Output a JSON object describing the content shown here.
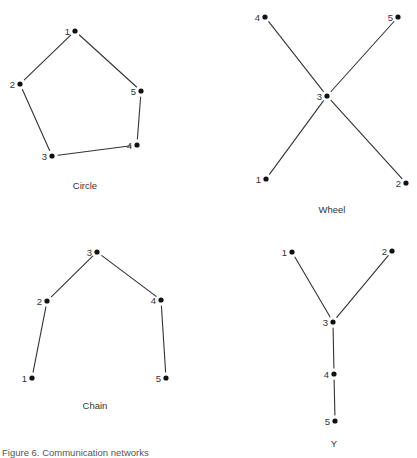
{
  "figure": {
    "caption": "Figure 6.  Communication networks",
    "ink_color": "#111111",
    "line_color": "#333333",
    "background": "#ffffff"
  },
  "networks": [
    {
      "id": "circle",
      "label": "Circle",
      "label_pos": [
        85,
        189
      ],
      "nodes": [
        {
          "id": "1",
          "x": 75,
          "y": 31
        },
        {
          "id": "2",
          "x": 20,
          "y": 84
        },
        {
          "id": "3",
          "x": 52,
          "y": 156
        },
        {
          "id": "4",
          "x": 137,
          "y": 145
        },
        {
          "id": "5",
          "x": 141,
          "y": 91
        }
      ],
      "edges": [
        [
          "1",
          "2"
        ],
        [
          "2",
          "3"
        ],
        [
          "3",
          "4"
        ],
        [
          "4",
          "5"
        ],
        [
          "5",
          "1"
        ]
      ]
    },
    {
      "id": "wheel",
      "label": "Wheel",
      "label_pos": [
        332,
        213
      ],
      "nodes": [
        {
          "id": "1",
          "x": 266,
          "y": 179
        },
        {
          "id": "2",
          "x": 406,
          "y": 183
        },
        {
          "id": "3",
          "x": 327,
          "y": 96
        },
        {
          "id": "4",
          "x": 265,
          "y": 17
        },
        {
          "id": "5",
          "x": 398,
          "y": 17
        }
      ],
      "edges": [
        [
          "3",
          "1"
        ],
        [
          "3",
          "2"
        ],
        [
          "3",
          "4"
        ],
        [
          "3",
          "5"
        ]
      ]
    },
    {
      "id": "chain",
      "label": "Chain",
      "label_pos": [
        95,
        409
      ],
      "nodes": [
        {
          "id": "1",
          "x": 32,
          "y": 378
        },
        {
          "id": "2",
          "x": 47,
          "y": 301
        },
        {
          "id": "3",
          "x": 97,
          "y": 252
        },
        {
          "id": "4",
          "x": 161,
          "y": 300
        },
        {
          "id": "5",
          "x": 166,
          "y": 378
        }
      ],
      "edges": [
        [
          "1",
          "2"
        ],
        [
          "2",
          "3"
        ],
        [
          "3",
          "4"
        ],
        [
          "4",
          "5"
        ]
      ]
    },
    {
      "id": "y",
      "label": "Y",
      "label_pos": [
        334,
        447
      ],
      "nodes": [
        {
          "id": "1",
          "x": 292,
          "y": 252
        },
        {
          "id": "2",
          "x": 392,
          "y": 251
        },
        {
          "id": "3",
          "x": 333,
          "y": 322
        },
        {
          "id": "4",
          "x": 334,
          "y": 374
        },
        {
          "id": "5",
          "x": 335,
          "y": 421
        }
      ],
      "edges": [
        [
          "1",
          "3"
        ],
        [
          "2",
          "3"
        ],
        [
          "3",
          "4"
        ],
        [
          "4",
          "5"
        ]
      ]
    }
  ]
}
